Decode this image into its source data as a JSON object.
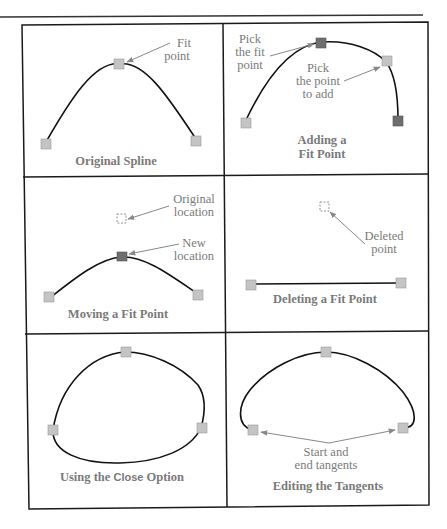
{
  "colors": {
    "fit_point": "#c4c4c4",
    "selected_point": "#6e6e6e",
    "curve": "#111111",
    "label": "#7a7a7a",
    "arrow": "#888888",
    "border": "#1a1a1a"
  },
  "panels": [
    {
      "id": "original-spline",
      "caption": "Original Spline",
      "labels": {
        "fit_point_1": "Fit",
        "fit_point_2": "point"
      }
    },
    {
      "id": "adding-fit-point",
      "caption_1": "Adding a",
      "caption_2": "Fit Point",
      "labels": {
        "pick_fit_1": "Pick",
        "pick_fit_2": "the fit",
        "pick_fit_3": "point",
        "pick_add_1": "Pick",
        "pick_add_2": "the point",
        "pick_add_3": "to add"
      }
    },
    {
      "id": "moving-fit-point",
      "caption": "Moving a Fit Point",
      "labels": {
        "original_1": "Original",
        "original_2": "location",
        "new_1": "New",
        "new_2": "location"
      }
    },
    {
      "id": "deleting-fit-point",
      "caption": "Deleting a Fit Point",
      "labels": {
        "deleted_1": "Deleted",
        "deleted_2": "point"
      }
    },
    {
      "id": "close-option",
      "caption_pre": "Using the ",
      "caption_keyword": "Close",
      "caption_post": " Option"
    },
    {
      "id": "editing-tangents",
      "caption": "Editing the Tangents",
      "labels": {
        "tangents_1": "Start and",
        "tangents_2": "end tangents"
      }
    }
  ]
}
